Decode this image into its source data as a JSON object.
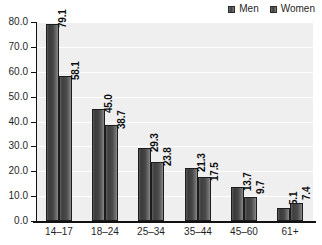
{
  "chart_data": {
    "type": "bar",
    "title": "",
    "subtitle": "",
    "xlabel": "",
    "ylabel": "",
    "ylim": [
      0,
      80
    ],
    "ytick_step": 10,
    "yticks": [
      "0.0",
      "10.0",
      "20.0",
      "30.0",
      "40.0",
      "50.0",
      "60.0",
      "70.0",
      "80.0"
    ],
    "grid": true,
    "legend_position": "top-right",
    "categories": [
      "14–17",
      "18–24",
      "25–34",
      "35–44",
      "45–60",
      "61+"
    ],
    "series": [
      {
        "name": "Men",
        "color": "#3f3f3f",
        "values": [
          79.1,
          45.0,
          29.3,
          21.3,
          13.7,
          5.1
        ],
        "labels": [
          "79.1",
          "45.0",
          "29.3",
          "21.3",
          "13.7",
          "5.1"
        ],
        "label_placement": [
          "inside",
          "inside",
          "inside",
          "inside",
          "inside",
          "outside"
        ]
      },
      {
        "name": "Women",
        "color": "#4a4a4a",
        "values": [
          58.1,
          38.7,
          23.8,
          17.5,
          9.7,
          7.4
        ],
        "labels": [
          "58.1",
          "38.7",
          "23.8",
          "17.5",
          "9.7",
          "7.4"
        ],
        "label_placement": [
          "inside",
          "inside",
          "inside",
          "inside",
          "outside",
          "outside"
        ]
      }
    ]
  },
  "legend": {
    "items": [
      {
        "label": "Men"
      },
      {
        "label": "Women"
      }
    ]
  }
}
